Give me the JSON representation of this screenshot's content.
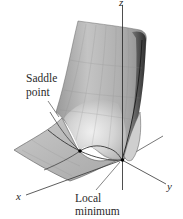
{
  "figure": {
    "type": "3d-surface-plot",
    "axes": {
      "x_label": "x",
      "y_label": "y",
      "z_label": "z"
    },
    "annotations": {
      "saddle": {
        "line1": "Saddle",
        "line2": "point"
      },
      "local_min": {
        "line1": "Local",
        "line2": "minimum"
      }
    },
    "colors": {
      "surface_light": "#e6e6e6",
      "surface_mid": "#b4b4b4",
      "surface_dark": "#6e6e6e",
      "lines": "#2a2a2a",
      "background": "#ffffff"
    }
  }
}
